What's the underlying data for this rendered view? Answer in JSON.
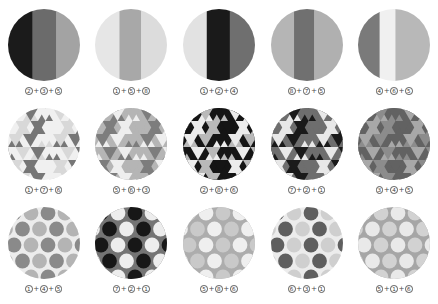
{
  "figure": {
    "background": "#ffffff",
    "rows": 3,
    "columns": 5,
    "swatch_shape": "circle"
  },
  "swatches": [
    {
      "id": "r1c1",
      "pattern": "vertical-stripes",
      "caption": "2+3+5",
      "numbers": [
        "2",
        "3",
        "5"
      ],
      "bands": [
        {
          "color": "#1b1b1b",
          "width": 34
        },
        {
          "color": "#6b6b6b",
          "width": 33
        },
        {
          "color": "#a3a3a3",
          "width": 33
        }
      ]
    },
    {
      "id": "r1c2",
      "pattern": "vertical-stripes",
      "caption": "1+5+8",
      "numbers": [
        "1",
        "5",
        "8"
      ],
      "bands": [
        {
          "color": "#e6e6e6",
          "width": 34
        },
        {
          "color": "#a8a8a8",
          "width": 30
        },
        {
          "color": "#dcdcdc",
          "width": 36
        }
      ]
    },
    {
      "id": "r1c3",
      "pattern": "vertical-stripes",
      "caption": "1+2+4",
      "numbers": [
        "1",
        "2",
        "4"
      ],
      "bands": [
        {
          "color": "#e2e2e2",
          "width": 33
        },
        {
          "color": "#1a1a1a",
          "width": 32
        },
        {
          "color": "#6f6f6f",
          "width": 35
        }
      ]
    },
    {
      "id": "r1c4",
      "pattern": "vertical-stripes",
      "caption": "8+7+5",
      "numbers": [
        "8",
        "7",
        "5"
      ],
      "bands": [
        {
          "color": "#b5b5b5",
          "width": 32
        },
        {
          "color": "#707070",
          "width": 28
        },
        {
          "color": "#b0b0b0",
          "width": 40
        }
      ]
    },
    {
      "id": "r1c5",
      "pattern": "vertical-stripes",
      "caption": "4+6+5",
      "numbers": [
        "4",
        "6",
        "5"
      ],
      "bands": [
        {
          "color": "#7a7a7a",
          "width": 30
        },
        {
          "color": "#f0f0f0",
          "width": 22
        },
        {
          "color": "#b8b8b8",
          "width": 48
        }
      ]
    },
    {
      "id": "r2c1",
      "pattern": "triangles",
      "caption": "1+7+6",
      "numbers": [
        "1",
        "7",
        "6"
      ],
      "colors": [
        "#f0f0f0",
        "#767676",
        "#d8d8d8"
      ]
    },
    {
      "id": "r2c2",
      "pattern": "triangles",
      "caption": "5+6+3",
      "numbers": [
        "5",
        "6",
        "3"
      ],
      "colors": [
        "#b5b5b5",
        "#eeeeee",
        "#7d7d7d"
      ]
    },
    {
      "id": "r2c3",
      "pattern": "triangles",
      "caption": "2+8+6",
      "numbers": [
        "2",
        "8",
        "6"
      ],
      "colors": [
        "#151515",
        "#b9b9b9",
        "#ececec"
      ]
    },
    {
      "id": "r2c4",
      "pattern": "triangles",
      "caption": "7+2+1",
      "numbers": [
        "7",
        "2",
        "1"
      ],
      "colors": [
        "#6e6e6e",
        "#1a1a1a",
        "#e8e8e8"
      ]
    },
    {
      "id": "r2c5",
      "pattern": "triangles",
      "caption": "3+4+5",
      "numbers": [
        "3",
        "4",
        "5"
      ],
      "colors": [
        "#626262",
        "#8c8c8c",
        "#a8a8a8"
      ]
    },
    {
      "id": "r3c1",
      "pattern": "polka-dots",
      "caption": "1+4+5",
      "numbers": [
        "1",
        "4",
        "5"
      ],
      "background": "#ececec",
      "dot_colors": [
        "#8a8a8a",
        "#b4b4b4"
      ]
    },
    {
      "id": "r3c2",
      "pattern": "polka-dots",
      "caption": "7+2+1",
      "numbers": [
        "7",
        "2",
        "1"
      ],
      "background": "#747474",
      "dot_colors": [
        "#171717",
        "#ededed"
      ]
    },
    {
      "id": "r3c3",
      "pattern": "polka-dots",
      "caption": "5+8+6",
      "numbers": [
        "5",
        "8",
        "6"
      ],
      "background": "#adadad",
      "dot_colors": [
        "#c9c9c9",
        "#efefef"
      ]
    },
    {
      "id": "r3c4",
      "pattern": "polka-dots",
      "caption": "6+3+1",
      "numbers": [
        "6",
        "3",
        "1"
      ],
      "background": "#ececec",
      "dot_colors": [
        "#5f5f5f",
        "#cfcfcf"
      ]
    },
    {
      "id": "r3c5",
      "pattern": "polka-dots",
      "caption": "5+1+6",
      "numbers": [
        "5",
        "1",
        "6"
      ],
      "background": "#a6a6a6",
      "dot_colors": [
        "#e9e9e9",
        "#d2d2d2"
      ]
    }
  ]
}
